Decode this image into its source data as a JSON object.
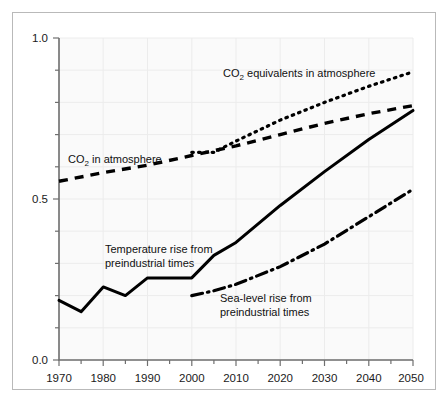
{
  "chart_data": {
    "type": "line",
    "title": "",
    "subtitle": "",
    "xlabel": "",
    "ylabel": "",
    "xlim": [
      1970,
      2050
    ],
    "ylim": [
      0.0,
      1.0
    ],
    "grid": true,
    "legend_position": "inline-annotations",
    "x_ticks_major": [
      1970,
      1980,
      1990,
      2000,
      2010,
      2020,
      2030,
      2040,
      2050
    ],
    "x_tick_labels": [
      "1970",
      "1980",
      "1990",
      "2000",
      "2010",
      "2020",
      "2030",
      "2040",
      "2050"
    ],
    "x_ticks_minor": [
      1975,
      1985,
      1995,
      2005,
      2015,
      2025,
      2035,
      2045
    ],
    "y_ticks_major": [
      0.0,
      0.5,
      1.0
    ],
    "y_tick_labels": [
      "0.0",
      "0.5",
      "1.0"
    ],
    "y_ticks_minor": [
      0.1,
      0.2,
      0.3,
      0.4,
      0.6,
      0.7,
      0.8,
      0.9
    ],
    "series": [
      {
        "name": "CO2 equivalents in atmosphere",
        "label_html": "CO<sub>2</sub> equivalents in atmosphere",
        "style": "dotted",
        "color": "#000000",
        "x": [
          2000,
          2005,
          2010,
          2020,
          2030,
          2040,
          2050
        ],
        "values": [
          0.645,
          0.645,
          0.68,
          0.745,
          0.8,
          0.85,
          0.895
        ]
      },
      {
        "name": "CO2 in atmosphere",
        "label_html": "CO<sub>2</sub> in atmosphere",
        "style": "dashed",
        "color": "#000000",
        "x": [
          1970,
          1980,
          1990,
          2000,
          2010,
          2020,
          2030,
          2040,
          2050
        ],
        "values": [
          0.555,
          0.582,
          0.605,
          0.635,
          0.665,
          0.7,
          0.735,
          0.765,
          0.79
        ]
      },
      {
        "name": "Temperature rise from preindustrial times",
        "label_html": "Temperature rise from preindustrial times",
        "style": "solid",
        "color": "#000000",
        "x": [
          1970,
          1975,
          1980,
          1985,
          1990,
          2000,
          2005,
          2010,
          2020,
          2030,
          2040,
          2050
        ],
        "values": [
          0.185,
          0.15,
          0.227,
          0.2,
          0.255,
          0.255,
          0.325,
          0.365,
          0.48,
          0.585,
          0.685,
          0.775
        ]
      },
      {
        "name": "Sea-level rise from preindustrial times",
        "label_html": "Sea-level rise from preindustrial times",
        "style": "dash-dot",
        "color": "#000000",
        "x": [
          2000,
          2005,
          2010,
          2020,
          2030,
          2040,
          2050
        ],
        "values": [
          0.2,
          0.215,
          0.235,
          0.29,
          0.36,
          0.445,
          0.53
        ]
      }
    ],
    "annotations": [
      {
        "id": "co2-equiv",
        "text": "CO2 equivalents in atmosphere",
        "x_px": 223,
        "y_px": 73
      },
      {
        "id": "co2",
        "text": "CO2 in atmosphere",
        "x_px": 68,
        "y_px": 159
      },
      {
        "id": "temperature",
        "text_line1": "Temperature rise from",
        "text_line2": "preindustrial times",
        "x_px": 105,
        "y_px": 249
      },
      {
        "id": "sea-level",
        "text_line1": "Sea-level rise from",
        "text_line2": "preindustrial times",
        "x_px": 220,
        "y_px": 298
      }
    ]
  },
  "labels": {
    "co2_equiv_prefix": "CO",
    "co2_equiv_sub": "2",
    "co2_equiv_suffix": " equivalents in atmosphere",
    "co2_prefix": "CO",
    "co2_sub": "2",
    "co2_suffix": " in atmosphere",
    "temperature_line1": "Temperature rise from",
    "temperature_line2": "preindustrial times",
    "sealevel_line1": "Sea-level rise from",
    "sealevel_line2": "preindustrial times"
  },
  "axes": {
    "y_top": "1.0",
    "y_mid": "0.5",
    "y_bottom": "0.0",
    "x0": "1970",
    "x1": "1980",
    "x2": "1990",
    "x3": "2000",
    "x4": "2010",
    "x5": "2020",
    "x6": "2030",
    "x7": "2040",
    "x8": "2050"
  },
  "colors": {
    "background": "#ffffff",
    "plot_background": "#fafafa",
    "frame_border": "#b9b9b9",
    "axis": "#6f6f6f",
    "gridline": "#ececec",
    "series_ink": "#000000",
    "text": "#1a1a1a"
  }
}
